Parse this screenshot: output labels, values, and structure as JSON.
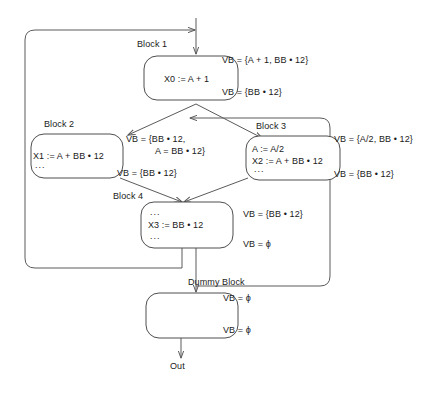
{
  "diagram": {
    "entry_label": "",
    "exit_label": "Out",
    "nodes": [
      {
        "id": "block1",
        "name": "Block 1",
        "lines": [
          "X0 := A + 1"
        ],
        "vb_in": "VB = {A + 1, BB • 12}",
        "vb_out": "VB = {BB • 12}"
      },
      {
        "id": "block2",
        "name": "Block 2",
        "lines": [
          "X1 := A + BB • 12",
          "..."
        ],
        "vb_in_line1": "VB = {BB • 12,",
        "vb_in_line2": "A = BB • 12}",
        "vb_out": "VB = {BB • 12}"
      },
      {
        "id": "block3",
        "name": "Block 3",
        "lines": [
          "A := A/2",
          "X2 := A + BB • 12",
          "..."
        ],
        "vb_in": "VB = {A/2, BB • 12}",
        "vb_out": "VB = {BB • 12}"
      },
      {
        "id": "block4",
        "name": "Block 4",
        "lines": [
          "...",
          "X3 := BB • 12",
          "..."
        ],
        "vb_in": "VB = {BB • 12}",
        "vb_out": "VB = ϕ"
      },
      {
        "id": "dummy",
        "name": "Dummy Block",
        "lines": [],
        "vb_in": "VB = ϕ",
        "vb_out": "VB = ϕ"
      }
    ],
    "colors": {
      "stroke": "#4f4f4f",
      "edge": "#5a5a5a",
      "text": "#1a1a1a",
      "background": "#ffffff"
    }
  }
}
